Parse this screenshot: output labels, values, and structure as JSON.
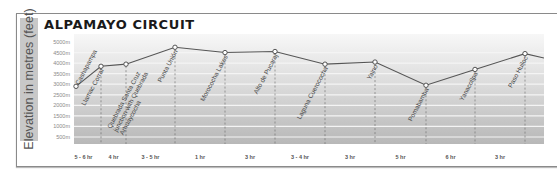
{
  "title": "ALPAMAYO CIRCUIT",
  "y_axis_label": "Elevation in metres (feet)",
  "chart_data": {
    "type": "line",
    "title": "ALPAMAYO CIRCUIT",
    "xlabel": "",
    "ylabel": "Elevation in metres (feet)",
    "ylim": [
      0,
      5000
    ],
    "y_ticks": [
      "5000m",
      "4500m",
      "4000m",
      "3500m",
      "3000m",
      "2500m",
      "2000m",
      "1500m",
      "1000m",
      "500m"
    ],
    "grid": true,
    "categories": [
      "Cashapampa",
      "Llamac Corral",
      "Quebrada Santa Cruz junction with Quebrada Arhuaycocha",
      "Punta Unión",
      "Morococha Lakes",
      "Alto de Pucaraj",
      "Laguna Cuerococha",
      "Yaino",
      "Pomabamba",
      "Yanacollpa",
      "Paso Huiloc"
    ],
    "values": [
      2900,
      3850,
      3950,
      4750,
      4500,
      4550,
      3950,
      4050,
      2950,
      3700,
      4450
    ],
    "segment_durations": [
      "5 - 6 hr",
      "4 hr",
      "3 - 5 hr",
      "1 hr",
      "3 hr",
      "3 - 4 hr",
      "3 hr",
      "5 hr",
      "6 hr",
      "3 hr"
    ]
  }
}
